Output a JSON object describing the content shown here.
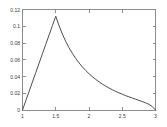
{
  "chart_data": {
    "type": "line",
    "title": "",
    "subtitle": "",
    "xlabel": "",
    "ylabel": "",
    "xlim": [
      1,
      3
    ],
    "ylim": [
      0,
      0.12
    ],
    "grid": false,
    "legend": null,
    "legend_position": "none",
    "box": true,
    "tick_direction": "in",
    "line_color": "#4d4d4d",
    "axis_color": "#8c8c8c",
    "background": "#ffffff",
    "xticks": [
      1,
      1.5,
      2,
      2.5,
      3
    ],
    "xtick_labels": [
      "1",
      "1.5",
      "2",
      "2.5",
      "3"
    ],
    "yticks": [
      0,
      0.02,
      0.04,
      0.06,
      0.08,
      0.1,
      0.12
    ],
    "ytick_labels": [
      "0",
      "0.02",
      "0.04",
      "0.06",
      "0.08",
      "0.1",
      "0.12"
    ],
    "series": [
      {
        "name": "curve",
        "x": [
          1.0,
          1.05,
          1.1,
          1.15,
          1.2,
          1.25,
          1.3,
          1.35,
          1.4,
          1.45,
          1.5,
          1.55,
          1.6,
          1.65,
          1.7,
          1.75,
          1.8,
          1.85,
          1.9,
          1.95,
          2.0,
          2.05,
          2.1,
          2.15,
          2.2,
          2.25,
          2.3,
          2.35,
          2.4,
          2.45,
          2.5,
          2.55,
          2.6,
          2.65,
          2.7,
          2.75,
          2.8,
          2.85,
          2.9,
          2.95,
          3.0
        ],
        "y": [
          0.0,
          0.0112,
          0.0224,
          0.0336,
          0.0448,
          0.056,
          0.0672,
          0.0784,
          0.0896,
          0.1008,
          0.112,
          0.1005,
          0.0906,
          0.0819,
          0.0743,
          0.0676,
          0.0616,
          0.0563,
          0.0515,
          0.0472,
          0.0433,
          0.0398,
          0.0366,
          0.0337,
          0.031,
          0.0286,
          0.0263,
          0.0242,
          0.0223,
          0.0205,
          0.0188,
          0.0172,
          0.0157,
          0.0143,
          0.0129,
          0.0115,
          0.0101,
          0.0086,
          0.0068,
          0.0042,
          0.0
        ]
      }
    ],
    "peak": {
      "x": 1.5,
      "y": 0.112
    }
  }
}
